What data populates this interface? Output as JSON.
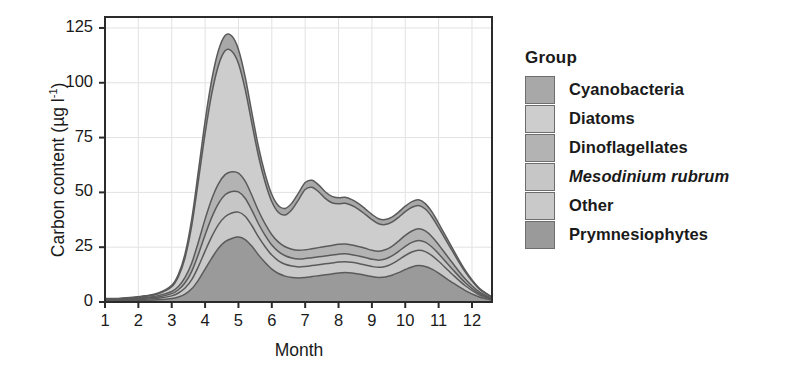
{
  "figure": {
    "background": "#ffffff"
  },
  "axes": {
    "y_title_text": "Carbon content (µg l",
    "y_title_sup": "-1",
    "y_title_tail": ")",
    "x_title": "Month",
    "y_ticks": [
      "0",
      "25",
      "50",
      "75",
      "100",
      "125"
    ],
    "x_ticks": [
      "1",
      "2",
      "3",
      "4",
      "5",
      "6",
      "7",
      "8",
      "9",
      "10",
      "11",
      "12"
    ],
    "ylim": [
      0,
      130
    ],
    "xlim": [
      1,
      12.6
    ],
    "grid": true,
    "grid_color": "#e2e2e2",
    "frame_color": "#2b2b2b"
  },
  "legend": {
    "title": "Group",
    "position": "right",
    "items": [
      {
        "label": "Cyanobacteria",
        "color": "#a8a8a8",
        "italic": false
      },
      {
        "label": "Diatoms",
        "color": "#cdcdcd",
        "italic": false
      },
      {
        "label": "Dinoflagellates",
        "color": "#b3b3b3",
        "italic": false
      },
      {
        "label": "Mesodinium rubrum",
        "color": "#c6c6c6",
        "italic": true
      },
      {
        "label": "Other",
        "color": "#c9c9c9",
        "italic": false
      },
      {
        "label": "Prymnesiophytes",
        "color": "#9a9a9a",
        "italic": false
      }
    ]
  },
  "chart_data": {
    "type": "area",
    "stacked": true,
    "title": "",
    "xlabel": "Month",
    "ylabel": "Carbon content (µg l-1)",
    "xlim": [
      1,
      12.6
    ],
    "ylim": [
      0,
      130
    ],
    "yticks": [
      0,
      25,
      50,
      75,
      100,
      125
    ],
    "xticks": [
      1,
      2,
      3,
      4,
      5,
      6,
      7,
      8,
      9,
      10,
      11,
      12
    ],
    "grid": true,
    "legend_position": "right",
    "x": [
      1.0,
      1.4,
      1.8,
      2.2,
      2.6,
      3.0,
      3.2,
      3.4,
      3.6,
      3.8,
      4.0,
      4.2,
      4.4,
      4.6,
      4.8,
      5.0,
      5.2,
      5.4,
      5.6,
      5.8,
      6.0,
      6.2,
      6.4,
      6.6,
      6.8,
      7.0,
      7.2,
      7.4,
      7.6,
      7.8,
      8.0,
      8.2,
      8.4,
      8.6,
      8.8,
      9.0,
      9.2,
      9.4,
      9.6,
      9.8,
      10.0,
      10.2,
      10.4,
      10.6,
      10.8,
      11.0,
      11.4,
      11.8,
      12.2,
      12.6
    ],
    "series": [
      {
        "name": "Prymnesiophytes",
        "color": "#9a9a9a",
        "stack_order": 1,
        "values": [
          0.6,
          0.6,
          0.7,
          0.8,
          1.0,
          1.6,
          2.3,
          3.6,
          6.0,
          10.0,
          15.0,
          20.0,
          24.5,
          27.5,
          29.0,
          29.6,
          28.5,
          25.5,
          21.5,
          18.0,
          15.0,
          13.0,
          11.8,
          11.2,
          11.0,
          11.2,
          11.6,
          12.0,
          12.4,
          12.8,
          13.2,
          13.4,
          13.2,
          12.8,
          12.2,
          11.6,
          11.2,
          11.4,
          12.2,
          13.4,
          14.8,
          16.0,
          16.6,
          16.2,
          15.0,
          13.2,
          9.0,
          5.2,
          2.4,
          0.8
        ]
      },
      {
        "name": "Other",
        "color": "#c9c9c9",
        "stack_order": 2,
        "values": [
          0.3,
          0.3,
          0.4,
          0.5,
          0.7,
          1.2,
          1.8,
          2.8,
          4.2,
          6.2,
          8.2,
          9.8,
          10.8,
          11.4,
          11.6,
          11.4,
          10.6,
          9.4,
          8.2,
          7.2,
          6.4,
          5.8,
          5.4,
          5.2,
          5.0,
          5.0,
          5.0,
          5.0,
          5.0,
          5.0,
          5.0,
          5.0,
          4.9,
          4.8,
          4.7,
          4.6,
          4.6,
          4.8,
          5.2,
          5.8,
          6.4,
          6.8,
          7.0,
          6.8,
          6.2,
          5.4,
          3.8,
          2.2,
          1.0,
          0.4
        ]
      },
      {
        "name": "Mesodinium rubrum",
        "color": "#c6c6c6",
        "stack_order": 3,
        "values": [
          0.2,
          0.2,
          0.3,
          0.4,
          0.6,
          1.0,
          1.5,
          2.4,
          3.8,
          5.6,
          7.4,
          8.8,
          9.6,
          10.0,
          9.8,
          9.2,
          8.2,
          7.0,
          6.0,
          5.2,
          4.6,
          4.2,
          3.9,
          3.7,
          3.6,
          3.6,
          3.6,
          3.6,
          3.6,
          3.6,
          3.6,
          3.6,
          3.5,
          3.4,
          3.4,
          3.3,
          3.3,
          3.4,
          3.6,
          3.9,
          4.2,
          4.4,
          4.5,
          4.3,
          3.9,
          3.4,
          2.4,
          1.4,
          0.6,
          0.2
        ]
      },
      {
        "name": "Dinoflagellates",
        "color": "#b3b3b3",
        "stack_order": 4,
        "values": [
          0.2,
          0.2,
          0.3,
          0.4,
          0.6,
          1.0,
          1.5,
          2.4,
          3.8,
          5.6,
          7.2,
          8.4,
          9.0,
          9.2,
          9.0,
          8.6,
          7.8,
          6.8,
          5.9,
          5.2,
          4.7,
          4.3,
          4.1,
          4.0,
          4.0,
          4.0,
          4.1,
          4.2,
          4.3,
          4.4,
          4.5,
          4.5,
          4.4,
          4.3,
          4.2,
          4.1,
          4.1,
          4.2,
          4.4,
          4.7,
          5.0,
          5.2,
          5.3,
          5.1,
          4.7,
          4.1,
          2.9,
          1.7,
          0.8,
          0.3
        ]
      },
      {
        "name": "Diatoms",
        "color": "#cdcdcd",
        "stack_order": 5,
        "values": [
          0.2,
          0.2,
          0.3,
          0.5,
          0.9,
          2.2,
          4.5,
          9.0,
          17.0,
          28.0,
          39.0,
          48.0,
          54.0,
          56.5,
          55.0,
          50.0,
          42.0,
          33.0,
          25.0,
          19.0,
          15.0,
          13.5,
          14.5,
          18.0,
          23.0,
          27.5,
          28.0,
          25.5,
          22.0,
          19.5,
          18.5,
          18.5,
          18.0,
          17.0,
          15.5,
          14.0,
          12.5,
          11.5,
          11.0,
          10.8,
          10.8,
          10.8,
          10.6,
          10.0,
          9.0,
          7.8,
          5.4,
          3.1,
          1.4,
          0.5
        ]
      },
      {
        "name": "Cyanobacteria",
        "color": "#a8a8a8",
        "stack_order": 6,
        "values": [
          0.1,
          0.1,
          0.1,
          0.2,
          0.3,
          0.6,
          1.0,
          1.8,
          3.0,
          4.4,
          5.6,
          6.4,
          6.8,
          7.0,
          6.9,
          6.4,
          5.7,
          4.9,
          4.2,
          3.7,
          3.3,
          3.1,
          3.0,
          3.0,
          3.1,
          3.2,
          3.2,
          3.1,
          3.0,
          2.9,
          2.8,
          2.8,
          2.7,
          2.6,
          2.5,
          2.4,
          2.3,
          2.3,
          2.3,
          2.4,
          2.5,
          2.6,
          2.6,
          2.5,
          2.3,
          2.0,
          1.4,
          0.8,
          0.4,
          0.1
        ]
      }
    ],
    "stack_totals_note": "peak total ~123 at month 4.8; secondary peak ~71 at month 7.1; autumn bump ~32 at month 10.4"
  }
}
